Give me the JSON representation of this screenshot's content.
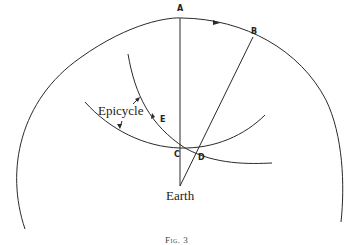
{
  "figure": {
    "caption": "Fig. 3",
    "colors": {
      "stroke": "#2a2a2a",
      "background": "#ffffff"
    },
    "labels": {
      "A": "A",
      "B": "B",
      "C": "C",
      "D": "D",
      "E": "E",
      "epicycle": "Epicycle",
      "earth": "Earth"
    },
    "elements": [
      {
        "id": "outer-circle",
        "type": "arc",
        "description": "large circle arc around Earth with direction arrow near A"
      },
      {
        "id": "deferent-arc",
        "type": "arc",
        "description": "arc passing through E and C"
      },
      {
        "id": "epicycle-arc",
        "type": "arc",
        "description": "epicycle arc passing through C and D"
      },
      {
        "id": "line-earth-A",
        "type": "line",
        "description": "vertical line from Earth to A"
      },
      {
        "id": "line-earth-B",
        "type": "line",
        "description": "line from Earth through D to B"
      }
    ]
  }
}
